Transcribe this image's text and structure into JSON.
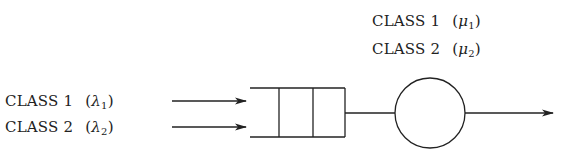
{
  "diagram": {
    "type": "single-server queue with two customer classes",
    "arrivals": [
      {
        "label": "CLASS 1",
        "symbol": "λ",
        "subscript": "1"
      },
      {
        "label": "CLASS 2",
        "symbol": "λ",
        "subscript": "2"
      }
    ],
    "service": [
      {
        "label": "CLASS 1",
        "symbol": "μ",
        "subscript": "1"
      },
      {
        "label": "CLASS 2",
        "symbol": "μ",
        "subscript": "2"
      }
    ],
    "colors": {
      "stroke": "#222222",
      "background": "#ffffff"
    }
  }
}
